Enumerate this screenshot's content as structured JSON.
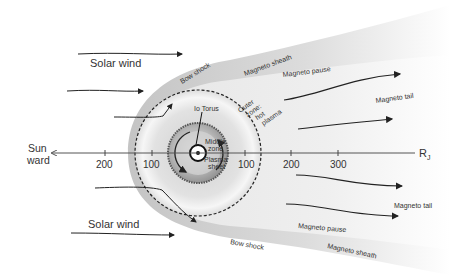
{
  "diagram": {
    "labels": {
      "solar_wind_top": "Solar wind",
      "solar_wind_bottom": "Solar wind",
      "bow_shock_top": "Bow shock",
      "bow_shock_bottom": "Bow shock",
      "magneto_sheath_top": "Magneto sheath",
      "magneto_sheath_bottom": "Magneto sheath",
      "magneto_pause_top": "Magneto pause",
      "magneto_pause_bottom": "Magneto pause",
      "magneto_tail_top": "Magneto tail",
      "magneto_tail_bottom": "Magneto tail",
      "io_torus": "Io Torus",
      "outer_zone_1": "Outer",
      "outer_zone_2": "zone:",
      "outer_zone_3": "hot",
      "outer_zone_4": "plasma",
      "middle_zone_1": "Middle",
      "middle_zone_2": "zone",
      "plasma_sheet_1": "Plasma",
      "plasma_sheet_2": "sheet",
      "sunward_1": "Sun",
      "sunward_2": "ward",
      "axis_unit": "R",
      "axis_unit_sub": "J"
    },
    "axis": {
      "ticks": [
        {
          "label": "200",
          "x": 105
        },
        {
          "label": "100",
          "x": 152
        },
        {
          "label": "100",
          "x": 245
        },
        {
          "label": "200",
          "x": 291
        },
        {
          "label": "300",
          "x": 338
        }
      ]
    },
    "colors": {
      "sheath": "#c8c8c8",
      "outer_zone": "#e4e4e4",
      "middle_zone": "#8a8a8a",
      "inner": "#d0d0d0",
      "line": "#222222",
      "axis": "#555555"
    }
  }
}
